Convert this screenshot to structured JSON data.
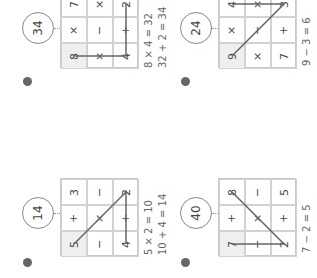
{
  "colors": {
    "line": "#666666",
    "start_cell": "#efefef",
    "grid": "#c9c9c9"
  },
  "puzzles": [
    {
      "badge": "4",
      "target": "34",
      "cells": [
        [
          "7",
          "×",
          "2"
        ],
        [
          "×",
          "−",
          "+"
        ],
        [
          "8",
          "×",
          "4"
        ]
      ],
      "start_cell": [
        2,
        0
      ],
      "path": [
        [
          2,
          0
        ],
        [
          2,
          2
        ],
        [
          0,
          2
        ]
      ],
      "equations": [
        "8 × 4 = 32",
        "32 + 2 = 34"
      ]
    },
    {
      "badge": "6",
      "target": "24",
      "cells": [
        [
          "4",
          "×",
          "3"
        ],
        [
          "×",
          "−",
          "+"
        ],
        [
          "9",
          "×",
          "7"
        ]
      ],
      "start_cell": [
        2,
        0
      ],
      "path": [
        [
          2,
          0
        ],
        [
          0,
          2
        ],
        [
          0,
          0
        ]
      ],
      "equations": [
        "9 − 3 = 6"
      ]
    },
    {
      "badge": "5",
      "target": "14",
      "cells": [
        [
          "3",
          "−",
          "2"
        ],
        [
          "+",
          "×",
          "+"
        ],
        [
          "5",
          "−",
          "4"
        ]
      ],
      "start_cell": [
        2,
        0
      ],
      "path": [
        [
          2,
          0
        ],
        [
          0,
          2
        ],
        [
          2,
          2
        ]
      ],
      "equations": [
        "5 × 2 = 10",
        "10 + 4 = 14"
      ]
    },
    {
      "badge": "7",
      "target": "40",
      "cells": [
        [
          "8",
          "−",
          "5"
        ],
        [
          "+",
          "×",
          "+"
        ],
        [
          "7",
          "−",
          "2"
        ]
      ],
      "start_cell": [
        2,
        0
      ],
      "path": [
        [
          2,
          0
        ],
        [
          2,
          2
        ],
        [
          0,
          0
        ]
      ],
      "equations": [
        "7 − 2 = 5"
      ]
    }
  ]
}
